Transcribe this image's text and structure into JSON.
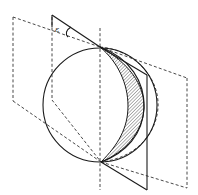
{
  "figure": {
    "type": "geometric-diagram",
    "angle_label": "ε",
    "colors": {
      "stroke": "#1a1a1a",
      "dash": "#333333",
      "hatch": "#555555",
      "background": "#ffffff"
    },
    "sphere": {
      "cx": 100,
      "cy": 105,
      "r": 57
    },
    "poles": {
      "top": [
        100,
        47
      ],
      "bottom": [
        101,
        162
      ]
    },
    "axis": {
      "x": 100,
      "y1": 28,
      "y2": 190
    }
  }
}
